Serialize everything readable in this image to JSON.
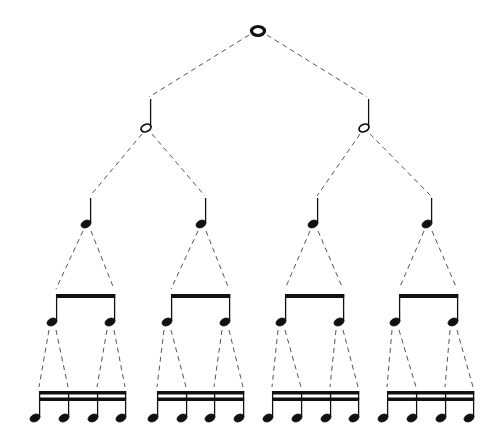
{
  "diagram": {
    "title": "Note value subdivision tree",
    "colors": {
      "ink": "#111111",
      "dash": "#555555",
      "background": "#ffffff"
    },
    "levels": [
      {
        "name": "whole",
        "count": 1,
        "icon": "whole-note-icon"
      },
      {
        "name": "half",
        "count": 2,
        "icon": "half-note-icon"
      },
      {
        "name": "quarter",
        "count": 4,
        "icon": "quarter-note-icon"
      },
      {
        "name": "eighth",
        "count": 8,
        "icon": "eighth-note-icon",
        "beamed_in_pairs": true
      },
      {
        "name": "sixteenth",
        "count": 16,
        "icon": "sixteenth-note-icon",
        "beamed_in_fours": true
      }
    ],
    "nodes": {
      "whole": [
        {
          "x": 258,
          "y": 31
        }
      ],
      "half": [
        {
          "x": 146,
          "y": 128
        },
        {
          "x": 364,
          "y": 128
        }
      ],
      "quarter": [
        {
          "x": 86,
          "y": 224
        },
        {
          "x": 201,
          "y": 224
        },
        {
          "x": 313,
          "y": 224
        },
        {
          "x": 427,
          "y": 224
        }
      ],
      "eighth_groups": [
        {
          "x1": 52,
          "x2": 110
        },
        {
          "x1": 167,
          "x2": 225
        },
        {
          "x1": 281,
          "x2": 339
        },
        {
          "x1": 395,
          "x2": 453
        }
      ],
      "sixteenth_groups": [
        {
          "xs": [
            35,
            64,
            93,
            121
          ]
        },
        {
          "xs": [
            153,
            182,
            210,
            239
          ]
        },
        {
          "xs": [
            268,
            297,
            326,
            354
          ]
        },
        {
          "xs": [
            383,
            412,
            441,
            469
          ]
        }
      ]
    }
  }
}
